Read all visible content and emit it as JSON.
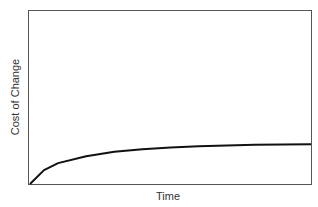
{
  "chart_data": {
    "type": "line",
    "title": "",
    "xlabel": "Time",
    "ylabel": "Cost of Change",
    "x_ticks": [],
    "y_ticks": [],
    "grid": false,
    "legend": null,
    "xlim": [
      0,
      1
    ],
    "ylim": [
      0,
      1
    ],
    "series": [
      {
        "name": "Cost of Change",
        "description": "Logarithmic-style curve rising quickly from origin and flattening to a plateau around 23% of axis height",
        "x": [
          0,
          0.05,
          0.1,
          0.2,
          0.3,
          0.4,
          0.5,
          0.6,
          0.7,
          0.8,
          0.9,
          1.0
        ],
        "y": [
          0,
          0.08,
          0.12,
          0.16,
          0.185,
          0.2,
          0.21,
          0.217,
          0.222,
          0.225,
          0.227,
          0.228
        ]
      }
    ],
    "colors": {
      "line": "#111111",
      "frame": "#555555",
      "text": "#333333"
    }
  }
}
